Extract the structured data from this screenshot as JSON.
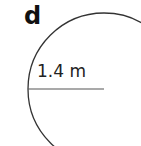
{
  "diagram": {
    "part_label": "d",
    "radius_label": "1.4 m",
    "shape": "circle",
    "stroke_color": "#333333"
  }
}
